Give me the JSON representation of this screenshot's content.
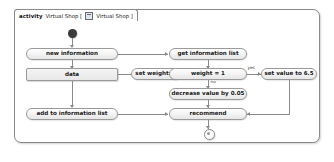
{
  "frame": {
    "keyword": "activity",
    "name": "Virtual Shop [",
    "icon": "diagram-icon",
    "qualifier": "Virtual Shop ]"
  },
  "nodes": {
    "initial": {
      "name": "initial-node",
      "label": ""
    },
    "new_information": {
      "label": "new information"
    },
    "data": {
      "label": "data"
    },
    "set_weight": {
      "label": "set weight: 1"
    },
    "add_to_information_list": {
      "label": "add to information list"
    },
    "get_information_list": {
      "label": "get information list"
    },
    "weight_equals_1": {
      "label": "weight = 1"
    },
    "set_value": {
      "label": "set value to 6.5"
    },
    "decrease_value": {
      "label": "decrease value by 0.05"
    },
    "recommend": {
      "label": "recommend"
    },
    "final": {
      "name": "final-node",
      "label": ""
    }
  },
  "edge_labels": {
    "yes": "yes",
    "no": "no"
  },
  "colors": {
    "frame_border": "#8a8a8a",
    "node_border": "#9a9a9a",
    "node_fill": "#f0f0f0",
    "edge": "#8a8a8a",
    "initial_fill": "#3a3a3a",
    "text": "#1a1a1a",
    "background": "#ffffff"
  }
}
